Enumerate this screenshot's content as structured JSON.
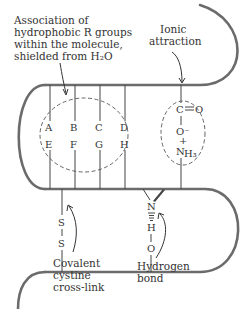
{
  "diagram": {
    "type": "protein tertiary structure stabilizing interactions",
    "colors": {
      "chain": "#6b6b6b",
      "text": "#333333",
      "background": "#ffffff"
    },
    "labels": {
      "hydrophobic": [
        "Association of",
        "hydrophobic R groups",
        "within the molecule,",
        "shielded from H₂O"
      ],
      "ionic": [
        "Ionic",
        "attraction"
      ],
      "covalent": [
        "Covalent",
        "cystine",
        "cross-link"
      ],
      "hydrogen": [
        "Hydrogen",
        "bond"
      ]
    },
    "r_groups": {
      "top_row": [
        "A",
        "B",
        "C",
        "D"
      ],
      "bottom_row": [
        "E",
        "F",
        "G",
        "H"
      ]
    },
    "ionic_group": {
      "carbonyl_c": "C",
      "carbonyl_o": "O",
      "oxide": "O⁻",
      "ammonium_n": "N",
      "ammonium_h": "H₃",
      "ammonium_charge": "+"
    },
    "disulfide": {
      "s1": "S",
      "s2": "S"
    },
    "hbond": {
      "n": "N",
      "h": "H",
      "o": "O"
    }
  }
}
